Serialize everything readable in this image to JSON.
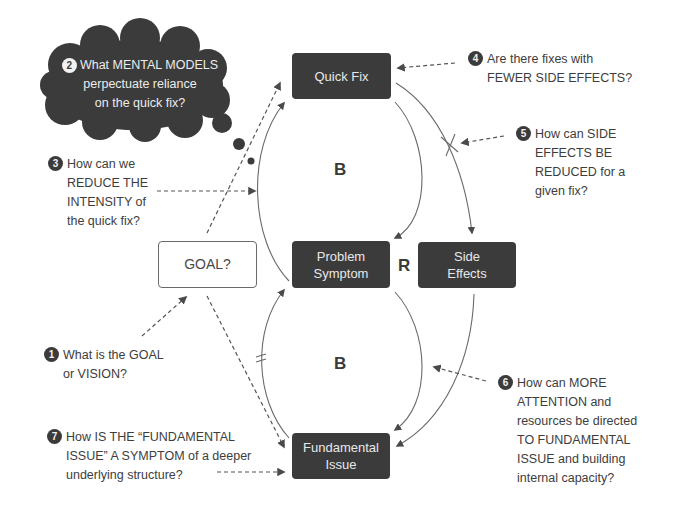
{
  "diagram": {
    "nodes": {
      "quick_fix": "Quick Fix",
      "problem_symptom": "Problem\nSymptom",
      "side_effects": "Side\nEffects",
      "fundamental_issue": "Fundamental\nIssue",
      "goal": "GOAL?"
    },
    "loop_labels": {
      "top_loop": "B",
      "middle_loop": "R",
      "bottom_loop": "B"
    },
    "colors": {
      "dark_box": "#3b3b3b",
      "box_text": "#e8e8e8",
      "line": "#6a6a6a",
      "text": "#3d3d3d",
      "background": "#ffffff"
    },
    "questions": [
      {
        "number": "1",
        "lines": [
          "What is the GOAL",
          "or VISION?"
        ]
      },
      {
        "number": "2",
        "lines": [
          "What MENTAL MODELS",
          "perpectuate reliance",
          "on the quick fix?"
        ]
      },
      {
        "number": "3",
        "lines": [
          "How can we",
          "REDUCE THE",
          "INTENSITY of",
          "the quick fix?"
        ]
      },
      {
        "number": "4",
        "lines": [
          "Are there fixes with",
          "FEWER SIDE EFFECTS?"
        ]
      },
      {
        "number": "5",
        "lines": [
          "How can SIDE",
          "EFFECTS BE",
          "REDUCED for a",
          "given fix?"
        ]
      },
      {
        "number": "6",
        "lines": [
          "How can MORE",
          "ATTENTION and",
          "resources be directed",
          "TO FUNDAMENTAL",
          "ISSUE and building",
          "internal capacity?"
        ]
      },
      {
        "number": "7",
        "lines": [
          "How IS THE “FUNDAMENTAL",
          "ISSUE” A SYMPTOM of a deeper",
          "underlying structure?"
        ]
      }
    ]
  }
}
